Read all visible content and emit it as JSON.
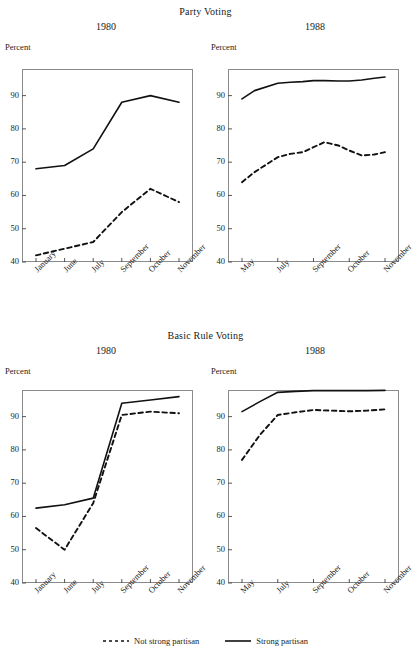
{
  "figure": {
    "legend": {
      "items": [
        {
          "label": "Not strong partisan",
          "style": "dashed"
        },
        {
          "label": "Strong partisan",
          "style": "solid"
        }
      ]
    },
    "sections": [
      {
        "title": "Party Voting",
        "panels": [
          {
            "year": "1980",
            "axis_label": "Percent",
            "yticks": [
              "40",
              "50",
              "60",
              "70",
              "80",
              "90"
            ],
            "xticks": [
              "January",
              "June",
              "July",
              "September",
              "October",
              "November"
            ]
          },
          {
            "year": "1988",
            "axis_label": "Percent",
            "yticks": [
              "40",
              "50",
              "60",
              "70",
              "80",
              "90"
            ],
            "xticks": [
              "May",
              "July",
              "September",
              "October",
              "November"
            ]
          }
        ]
      },
      {
        "title": "Basic Rule Voting",
        "panels": [
          {
            "year": "1980",
            "axis_label": "Percent",
            "yticks": [
              "40",
              "50",
              "60",
              "70",
              "80",
              "90"
            ],
            "xticks": [
              "January",
              "June",
              "July",
              "September",
              "October",
              "November"
            ]
          },
          {
            "year": "1988",
            "axis_label": "Percent",
            "yticks": [
              "40",
              "50",
              "60",
              "70",
              "80",
              "90"
            ],
            "xticks": [
              "May",
              "July",
              "September",
              "October",
              "November"
            ]
          }
        ]
      }
    ]
  },
  "chart_data": [
    {
      "type": "line",
      "title": "Party Voting",
      "subtitle": "1980",
      "xlabel": "",
      "ylabel": "Percent",
      "ylim": [
        40,
        98
      ],
      "grid": false,
      "legend_position": "bottom",
      "categories": [
        "January",
        "June",
        "July",
        "September",
        "October",
        "November"
      ],
      "series": [
        {
          "name": "Strong partisan",
          "style": "solid",
          "values": [
            68,
            69,
            74,
            88,
            90,
            88
          ]
        },
        {
          "name": "Not strong partisan",
          "style": "dashed",
          "values": [
            42,
            44,
            46,
            55,
            62,
            58
          ]
        }
      ]
    },
    {
      "type": "line",
      "title": "Party Voting",
      "subtitle": "1988",
      "xlabel": "",
      "ylabel": "Percent",
      "ylim": [
        40,
        98
      ],
      "grid": false,
      "legend_position": "bottom",
      "categories": [
        "May",
        "July",
        "September",
        "October",
        "November"
      ],
      "x": [
        0,
        0.35,
        1,
        1.35,
        1.7,
        2,
        2.3,
        2.7,
        3,
        3.35,
        3.7,
        4
      ],
      "series": [
        {
          "name": "Strong partisan",
          "style": "solid",
          "values": [
            89,
            91.5,
            93.7,
            94,
            94.2,
            94.5,
            94.5,
            94.4,
            94.4,
            94.7,
            95.2,
            95.6
          ]
        },
        {
          "name": "Not strong partisan",
          "style": "dashed",
          "values": [
            64,
            67,
            71.5,
            72.5,
            73,
            74.5,
            76,
            75,
            73.5,
            72,
            72.3,
            73
          ]
        }
      ]
    },
    {
      "type": "line",
      "title": "Basic Rule Voting",
      "subtitle": "1980",
      "xlabel": "",
      "ylabel": "Percent",
      "ylim": [
        40,
        98
      ],
      "grid": false,
      "legend_position": "bottom",
      "categories": [
        "January",
        "June",
        "July",
        "September",
        "October",
        "November"
      ],
      "series": [
        {
          "name": "Strong partisan",
          "style": "solid",
          "values": [
            62.5,
            63.5,
            65.5,
            94,
            95,
            96
          ]
        },
        {
          "name": "Not strong partisan",
          "style": "dashed",
          "values": [
            56.5,
            50,
            64,
            90.5,
            91.5,
            91
          ]
        }
      ]
    },
    {
      "type": "line",
      "title": "Basic Rule Voting",
      "subtitle": "1988",
      "xlabel": "",
      "ylabel": "Percent",
      "ylim": [
        40,
        98
      ],
      "grid": false,
      "legend_position": "bottom",
      "categories": [
        "May",
        "July",
        "September",
        "October",
        "November"
      ],
      "x": [
        0,
        0.5,
        1,
        1.5,
        2,
        2.5,
        3,
        3.5,
        4
      ],
      "series": [
        {
          "name": "Strong partisan",
          "style": "solid",
          "values": [
            91.5,
            94.5,
            97.3,
            97.6,
            97.8,
            97.8,
            97.8,
            97.8,
            97.9
          ]
        },
        {
          "name": "Not strong partisan",
          "style": "dashed",
          "values": [
            77,
            84.5,
            90.5,
            91.3,
            92,
            91.8,
            91.6,
            91.8,
            92.2
          ]
        }
      ]
    }
  ]
}
